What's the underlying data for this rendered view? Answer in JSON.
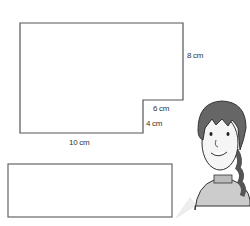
{
  "diagram": {
    "shape": "L-shaped rectangle",
    "labels": {
      "right_side": "8 cm",
      "notch_top": "6 cm",
      "notch_side": "4 cm",
      "bottom": "10 cm"
    }
  },
  "answer_box": {
    "text": ""
  },
  "character": {
    "description": "cartoon girl with braid"
  },
  "colors": {
    "line": "#555555",
    "hair": "#666666",
    "skin": "#f5f5f5"
  }
}
